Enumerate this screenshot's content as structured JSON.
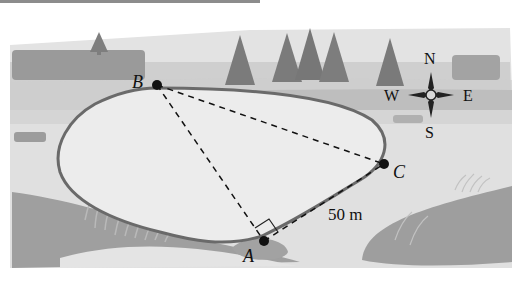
{
  "figure": {
    "type": "geometry-word-problem-illustration",
    "points": [
      {
        "id": "B",
        "label": "B",
        "x": 157,
        "y": 85
      },
      {
        "id": "A",
        "label": "A",
        "x": 264,
        "y": 241
      },
      {
        "id": "C",
        "label": "C",
        "x": 384,
        "y": 164
      }
    ],
    "segments": [
      {
        "from": "B",
        "to": "A",
        "style": "dashed"
      },
      {
        "from": "B",
        "to": "C",
        "style": "dashed"
      },
      {
        "from": "A",
        "to": "C",
        "style": "dashed",
        "label": "50 m"
      }
    ],
    "right_angle_at": "A",
    "distance_label": "50 m",
    "compass": {
      "north": "N",
      "east": "E",
      "south": "S",
      "west": "W"
    }
  },
  "colors": {
    "sky": "#ffffff",
    "far_field": "#d4d4d4",
    "mid_field": "#bdbdbd",
    "dark_band": "#a9a9a9",
    "pond_fill": "#e9e9e9",
    "pond_edge": "#6e6e6e",
    "ground_patch": "#9e9e9e",
    "tree": "#7a7a7a",
    "ink": "#111111"
  }
}
